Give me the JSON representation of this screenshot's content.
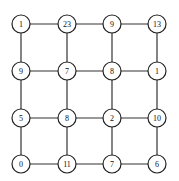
{
  "diagram": {
    "type": "grid-graph",
    "rows": 4,
    "cols": 4,
    "col_x": [
      21,
      67,
      112,
      157
    ],
    "row_y": [
      24,
      71,
      118,
      164
    ],
    "node_radius": 9,
    "colors": {
      "stroke": "#222222",
      "fill": "#ffffff",
      "text": "#111111"
    },
    "values": [
      [
        "1",
        "23",
        "9",
        "13"
      ],
      [
        "9",
        "7",
        "8",
        "1"
      ],
      [
        "5",
        "8",
        "2",
        "10"
      ],
      [
        "0",
        "11",
        "7",
        "6"
      ]
    ]
  }
}
